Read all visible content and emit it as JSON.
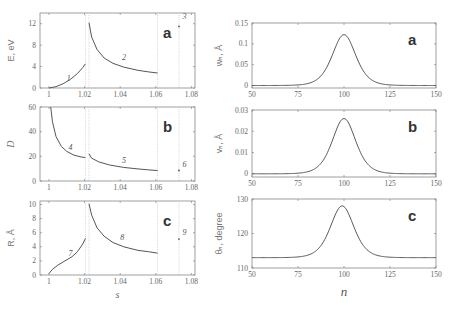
{
  "chart_data": [
    {
      "id": "left-a",
      "type": "line",
      "panel_label": "a",
      "ylabel": "E, eV",
      "xlabel": "",
      "xlim": [
        0.995,
        1.082
      ],
      "ylim": [
        0,
        14
      ],
      "xticks": [
        1,
        1.02,
        1.04,
        1.06,
        1.08
      ],
      "xtick_labels": [
        "1",
        "1.02",
        "1.04",
        "1.06",
        "1.08"
      ],
      "yticks": [
        0,
        4,
        8,
        12
      ],
      "ytick_labels": [
        "0",
        "4",
        "8",
        "12"
      ],
      "box": {
        "x": 40,
        "y": 13,
        "w": 155,
        "h": 75
      },
      "series": [
        {
          "name": "1",
          "x": [
            1.0,
            1.004,
            1.008,
            1.012,
            1.016,
            1.019,
            1.0205
          ],
          "y": [
            0,
            0.25,
            0.8,
            1.6,
            2.7,
            3.8,
            4.5
          ]
        },
        {
          "name": "2",
          "x": [
            1.0225,
            1.024,
            1.027,
            1.031,
            1.036,
            1.042,
            1.05,
            1.056,
            1.061
          ],
          "y": [
            12.2,
            9.5,
            7.2,
            5.6,
            4.6,
            3.9,
            3.3,
            3.0,
            2.8
          ]
        },
        {
          "name": "3",
          "x": [
            1.073
          ],
          "y": [
            11.5
          ]
        }
      ],
      "curve_labels": [
        {
          "text": "1",
          "x": 1.01,
          "y": 1.4
        },
        {
          "text": "2",
          "x": 1.041,
          "y": 5.2
        },
        {
          "text": "3",
          "x": 1.075,
          "y": 12.8
        }
      ],
      "dotted_verticals": [
        1.0205,
        1.0225,
        1.061,
        1.073
      ]
    },
    {
      "id": "left-b",
      "type": "line",
      "panel_label": "b",
      "ylabel": "D",
      "xlabel": "",
      "xlim": [
        0.995,
        1.082
      ],
      "ylim": [
        0,
        60
      ],
      "xticks": [
        1,
        1.02,
        1.04,
        1.06,
        1.08
      ],
      "xtick_labels": [
        "1",
        "1.02",
        "1.04",
        "1.06",
        "1.08"
      ],
      "yticks": [
        0,
        20,
        40,
        60
      ],
      "ytick_labels": [
        "0",
        "20",
        "40",
        "60"
      ],
      "box": {
        "x": 40,
        "y": 107,
        "w": 155,
        "h": 74
      },
      "series": [
        {
          "name": "4",
          "x": [
            1.001,
            1.002,
            1.004,
            1.007,
            1.01,
            1.014,
            1.018,
            1.0205
          ],
          "y": [
            60,
            48,
            36,
            28,
            24,
            21,
            19.5,
            19
          ]
        },
        {
          "name": "5",
          "x": [
            1.0225,
            1.024,
            1.028,
            1.034,
            1.042,
            1.05,
            1.056,
            1.061
          ],
          "y": [
            22,
            18.5,
            15.5,
            13,
            11,
            9.8,
            9,
            8.5
          ]
        },
        {
          "name": "6",
          "x": [
            1.073
          ],
          "y": [
            8.5
          ]
        }
      ],
      "curve_labels": [
        {
          "text": "4",
          "x": 1.011,
          "y": 25
        },
        {
          "text": "5",
          "x": 1.041,
          "y": 14.5
        },
        {
          "text": "6",
          "x": 1.075,
          "y": 11
        }
      ],
      "dotted_verticals": [
        1.0205,
        1.0225,
        1.061,
        1.073
      ]
    },
    {
      "id": "left-c",
      "type": "line",
      "panel_label": "c",
      "ylabel": "R, Å",
      "xlabel": "s",
      "xlim": [
        0.995,
        1.082
      ],
      "ylim": [
        0,
        10.5
      ],
      "xticks": [
        1,
        1.02,
        1.04,
        1.06,
        1.08
      ],
      "xtick_labels": [
        "1",
        "1.02",
        "1.04",
        "1.06",
        "1.08"
      ],
      "yticks": [
        0,
        2,
        4,
        6,
        8,
        10
      ],
      "ytick_labels": [
        "0",
        "2",
        "4",
        "6",
        "8",
        "10"
      ],
      "box": {
        "x": 40,
        "y": 201,
        "w": 155,
        "h": 74
      },
      "series": [
        {
          "name": "7",
          "x": [
            1.0,
            1.002,
            1.005,
            1.009,
            1.013,
            1.016,
            1.019,
            1.0205
          ],
          "y": [
            0.2,
            0.8,
            1.4,
            2.0,
            2.6,
            3.3,
            4.4,
            5.2
          ]
        },
        {
          "name": "8",
          "x": [
            1.0225,
            1.024,
            1.027,
            1.031,
            1.036,
            1.042,
            1.05,
            1.056,
            1.061
          ],
          "y": [
            10.1,
            8.5,
            6.7,
            5.5,
            4.6,
            4.0,
            3.5,
            3.3,
            3.1
          ]
        },
        {
          "name": "9",
          "x": [
            1.073
          ],
          "y": [
            5.1
          ]
        }
      ],
      "curve_labels": [
        {
          "text": "7",
          "x": 1.011,
          "y": 2.7
        },
        {
          "text": "8",
          "x": 1.04,
          "y": 4.9
        },
        {
          "text": "9",
          "x": 1.075,
          "y": 5.7
        }
      ],
      "dotted_verticals": [
        1.0205,
        1.0225,
        1.061,
        1.073
      ]
    },
    {
      "id": "right-a",
      "type": "line",
      "panel_label": "a",
      "ylabel": "w_n, Å",
      "xlabel": "",
      "xlim": [
        50,
        150
      ],
      "ylim": [
        -0.006,
        0.15
      ],
      "xticks": [
        50,
        75,
        100,
        125,
        150
      ],
      "xtick_labels": [
        "50",
        "75",
        "100",
        "125",
        "150"
      ],
      "yticks": [
        0,
        0.05,
        0.1,
        0.15
      ],
      "ytick_labels": [
        "0",
        "0.05",
        "0.1",
        "0.15"
      ],
      "box": {
        "x": 252,
        "y": 23,
        "w": 184,
        "h": 65
      },
      "peak": {
        "center": 100,
        "amplitude": 0.122,
        "baseline": 0,
        "width": 8.5
      }
    },
    {
      "id": "right-b",
      "type": "line",
      "panel_label": "b",
      "ylabel": "v_n, Å",
      "xlabel": "",
      "xlim": [
        50,
        150
      ],
      "ylim": [
        -0.0015,
        0.03
      ],
      "xticks": [
        50,
        75,
        100,
        125,
        150
      ],
      "xtick_labels": [
        "50",
        "75",
        "100",
        "125",
        "150"
      ],
      "yticks": [
        0,
        0.01,
        0.02,
        0.03
      ],
      "ytick_labels": [
        "0",
        "0.01",
        "0.02",
        "0.03"
      ],
      "box": {
        "x": 252,
        "y": 110,
        "w": 184,
        "h": 67
      },
      "peak": {
        "center": 100,
        "amplitude": 0.026,
        "baseline": 0,
        "width": 8.5
      }
    },
    {
      "id": "right-c",
      "type": "line",
      "panel_label": "c",
      "ylabel": "θ_n, degree",
      "xlabel": "n",
      "xlim": [
        50,
        150
      ],
      "ylim": [
        110,
        130
      ],
      "xticks": [
        50,
        75,
        100,
        125,
        150
      ],
      "xtick_labels": [
        "50",
        "75",
        "100",
        "125",
        "150"
      ],
      "yticks": [
        110,
        120,
        130
      ],
      "ytick_labels": [
        "110",
        "120",
        "130"
      ],
      "box": {
        "x": 252,
        "y": 199,
        "w": 184,
        "h": 69
      },
      "peak": {
        "center": 99,
        "amplitude": 15,
        "baseline": 113,
        "width": 8.5
      }
    }
  ]
}
